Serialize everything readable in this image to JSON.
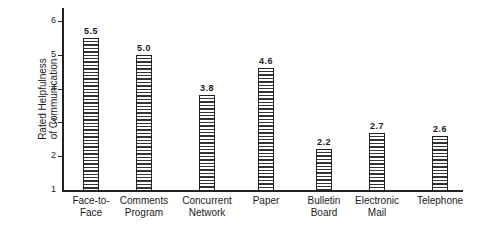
{
  "chart_data": {
    "type": "bar",
    "title": "",
    "xlabel": "",
    "ylabel": "Rated Helpfulness of Communication",
    "ylabel_lines": [
      "Rated Helpfulness",
      "of Communication"
    ],
    "ylim": [
      1,
      6
    ],
    "yticks": [
      1,
      2,
      3,
      4,
      5,
      6
    ],
    "grid": false,
    "legend": null,
    "categories": [
      "Face-to-Face",
      "Comments Program",
      "Concurrent Network",
      "Paper",
      "Bulletin Board",
      "Electronic Mail",
      "Telephone"
    ],
    "category_lines": [
      [
        "Face-to-",
        "Face"
      ],
      [
        "Comments",
        "Program"
      ],
      [
        "Concurrent",
        "Network"
      ],
      [
        "Paper",
        ""
      ],
      [
        "Bulletin",
        "Board"
      ],
      [
        "Electronic",
        "Mail"
      ],
      [
        "Telephone",
        ""
      ]
    ],
    "values": [
      5.5,
      5.0,
      3.8,
      4.6,
      2.2,
      2.7,
      2.6
    ],
    "value_labels": [
      "5.5",
      "5.0",
      "3.8",
      "4.6",
      "2.2",
      "2.7",
      "2.6"
    ],
    "bar_pattern": "horizontal-hatch"
  }
}
